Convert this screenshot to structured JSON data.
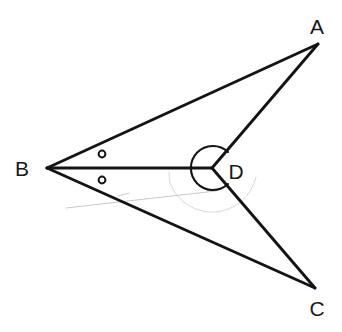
{
  "figure": {
    "kind": "geometry-diagram",
    "background_color": "#ffffff",
    "ink_color": "#141414",
    "ghost_color": "#c9c9cd",
    "width": 342,
    "height": 332,
    "points": {
      "A": {
        "label": "A",
        "x": 318,
        "y": 44,
        "label_x": 317,
        "label_y": 26
      },
      "B": {
        "label": "B",
        "x": 47,
        "y": 168,
        "label_x": 22,
        "label_y": 168
      },
      "C": {
        "label": "C",
        "x": 315,
        "y": 288,
        "label_x": 317,
        "label_y": 308
      },
      "D": {
        "label": "D",
        "x": 212,
        "y": 168,
        "label_x": 236,
        "label_y": 171
      }
    },
    "segments": [
      {
        "name": "segment-BA",
        "from": "B",
        "to": "A"
      },
      {
        "name": "segment-AD",
        "from": "A",
        "to": "D"
      },
      {
        "name": "segment-BD",
        "from": "B",
        "to": "D"
      },
      {
        "name": "segment-BC",
        "from": "B",
        "to": "C"
      },
      {
        "name": "segment-DC",
        "from": "D",
        "to": "C"
      }
    ],
    "angle_marks": {
      "reflex_angle_at_D": {
        "name": "reflex-angle-arc-D",
        "center": "D",
        "radius": 22,
        "start_deg": -44,
        "end_deg": 47,
        "sweep": "reflex"
      },
      "congruent_angle_ticks_at_B": [
        {
          "name": "angle-tick-abd",
          "x": 102,
          "y": 154,
          "r": 3.4
        },
        {
          "name": "angle-tick-dbc",
          "x": 102,
          "y": 180,
          "r": 3.4
        }
      ]
    },
    "erased_marks": [
      {
        "name": "erased-pencil-line",
        "x1": 66,
        "y1": 208,
        "x2": 216,
        "y2": 191
      },
      {
        "name": "erased-pencil-arc",
        "cx": 212,
        "cy": 168,
        "r": 45,
        "start_deg": 12,
        "end_deg": 160
      },
      {
        "name": "erased-pencil-tick",
        "x1": 118,
        "y1": 196,
        "x2": 128,
        "y2": 193
      }
    ]
  }
}
